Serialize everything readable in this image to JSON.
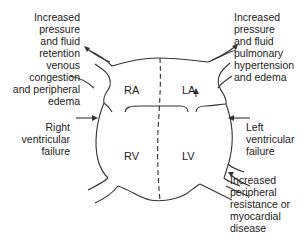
{
  "diagram": {
    "chambers": {
      "ra": "RA",
      "la": "LA",
      "rv": "RV",
      "lv": "LV"
    },
    "labels": {
      "right_atrial_effect": [
        "Increased",
        "pressure",
        "and fluid",
        "retention",
        "venous",
        "congestion",
        "and peripheral",
        "edema"
      ],
      "left_atrial_effect": [
        "Increased",
        "pressure",
        "and fluid",
        "pulmonary",
        "hypertension",
        "and edema"
      ],
      "right_ventricular_failure": [
        "Right",
        "ventricular",
        "failure"
      ],
      "left_ventricular_failure": [
        "Left",
        "ventricular",
        "failure"
      ],
      "lv_cause": [
        "Increased",
        "peripheral",
        "resistance or",
        "myocardial",
        "disease"
      ]
    },
    "colors": {
      "line": "#333333",
      "text": "#222222",
      "background": "#ffffff"
    }
  }
}
